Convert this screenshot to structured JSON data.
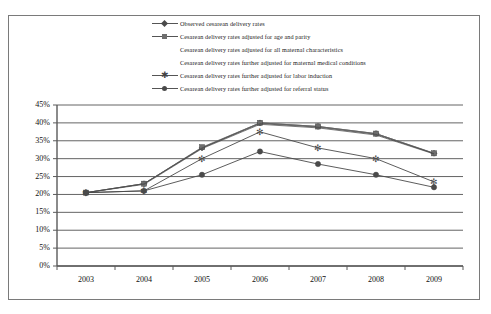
{
  "chart_data": {
    "type": "line",
    "title": "",
    "xlabel": "",
    "ylabel": "",
    "categories": [
      "2003",
      "2004",
      "2005",
      "2006",
      "2007",
      "2008",
      "2009"
    ],
    "ylim": [
      0,
      45
    ],
    "ytick_labels": [
      "45%",
      "40%",
      "35%",
      "30%",
      "25%",
      "20%",
      "15%",
      "10%",
      "5%",
      "0%"
    ],
    "ytick_values": [
      45,
      40,
      35,
      30,
      25,
      20,
      15,
      10,
      5,
      0
    ],
    "grid": true,
    "legend_position": "top",
    "series": [
      {
        "name": "Observed cesarean delivery rates",
        "marker": "diamond",
        "values": [
          20.5,
          23.0,
          33.0,
          40.0,
          39.0,
          37.0,
          31.5
        ]
      },
      {
        "name": "Cesarean delivery rates adjusted for age and parity",
        "marker": "square",
        "values": [
          20.5,
          23.0,
          33.2,
          40.0,
          39.0,
          37.0,
          31.5
        ]
      },
      {
        "name": "Cesarean delivery rates adjusted for all maternal characteristics",
        "marker": "none",
        "values": [
          20.5,
          23.0,
          33.0,
          39.8,
          38.8,
          36.8,
          31.4
        ]
      },
      {
        "name": "Cesarean delivery rates further adjusted for maternal medical conditions",
        "marker": "none",
        "values": [
          20.5,
          22.8,
          32.8,
          39.6,
          38.6,
          36.6,
          31.3
        ]
      },
      {
        "name": "Cesarean delivery rates further adjusted for labor induction",
        "marker": "star",
        "values": [
          20.5,
          21.0,
          30.0,
          37.5,
          33.0,
          30.0,
          23.5
        ]
      },
      {
        "name": "Cesarean delivery rates further adjusted for referral status",
        "marker": "circle",
        "values": [
          20.5,
          21.0,
          25.5,
          32.0,
          28.5,
          25.5,
          22.0
        ]
      }
    ]
  },
  "legend": {
    "items": [
      {
        "label": "Observed cesarean delivery rates",
        "marker": "diamond",
        "has_key": true
      },
      {
        "label": "Cesarean delivery rates adjusted for age and parity",
        "marker": "square",
        "has_key": true
      },
      {
        "label": "Cesarean delivery rates adjusted for all maternal characteristics",
        "marker": "none",
        "has_key": false
      },
      {
        "label": "Cesarean delivery rates further adjusted for maternal medical conditions",
        "marker": "none",
        "has_key": false
      },
      {
        "label": "Cesarean delivery rates further adjusted for labor induction",
        "marker": "star",
        "has_key": true
      },
      {
        "label": "Cesarean delivery rates further adjusted for referral status",
        "marker": "circle",
        "has_key": true
      }
    ]
  },
  "colors": {
    "axis": "#5a5a5a",
    "grid": "#3c3c3c",
    "frame": "#7a7a7a",
    "series_dark": "#4a4a4a",
    "series_mid": "#6e6e6e",
    "text": "#101010"
  }
}
